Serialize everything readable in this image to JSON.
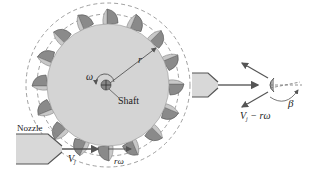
{
  "diagram": {
    "labels": {
      "nozzle": "Nozzle",
      "shaft": "Shaft",
      "omega": "ω",
      "radius": "r",
      "jet_velocity": "V",
      "jet_velocity_sub": "j",
      "bucket_speed": "rω",
      "relative_velocity": "V",
      "relative_velocity_sub": "j",
      "relative_velocity_rest": " − rω",
      "angle": "β"
    },
    "colors": {
      "disk": "#d4d4d4",
      "bucket": "#8a8a8a",
      "bucket_light": "#c8c8c8",
      "line": "#555555",
      "nozzle": "#d8d8d8",
      "dashed": "#888888"
    },
    "bucket_count": 16
  }
}
